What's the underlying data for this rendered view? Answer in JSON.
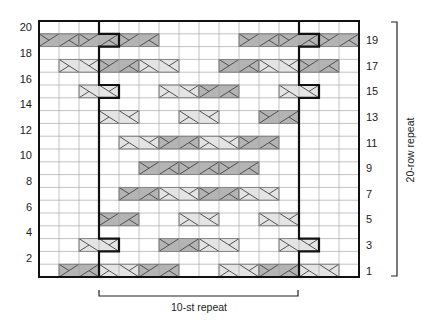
{
  "chart_data": {
    "type": "knitting-cable-chart",
    "title": "",
    "columns": 16,
    "rows": 20,
    "left_row_labels": [
      "2",
      "4",
      "6",
      "8",
      "10",
      "12",
      "14",
      "16",
      "18",
      "20"
    ],
    "right_row_labels": [
      "1",
      "3",
      "5",
      "7",
      "9",
      "11",
      "13",
      "15",
      "17",
      "19"
    ],
    "stitch_repeat_label": "10-st repeat",
    "row_repeat_label": "20-row repeat",
    "repeat_columns": [
      3,
      12
    ],
    "repeat_jog_rows": [
      3,
      15,
      19
    ],
    "colors": {
      "light": "#e4e4e4",
      "dark": "#b4b4b4",
      "grid": "#9a9a9a",
      "outline": "#111111"
    },
    "cables": [
      {
        "row": 19,
        "col": 0,
        "shade": "dark",
        "dir": "right"
      },
      {
        "row": 19,
        "col": 2,
        "shade": "dark",
        "dir": "right"
      },
      {
        "row": 19,
        "col": 4,
        "shade": "dark",
        "dir": "right"
      },
      {
        "row": 19,
        "col": 10,
        "shade": "dark",
        "dir": "right"
      },
      {
        "row": 19,
        "col": 12,
        "shade": "dark",
        "dir": "right"
      },
      {
        "row": 19,
        "col": 14,
        "shade": "dark",
        "dir": "right"
      },
      {
        "row": 17,
        "col": 1,
        "shade": "light",
        "dir": "left"
      },
      {
        "row": 17,
        "col": 3,
        "shade": "dark",
        "dir": "right"
      },
      {
        "row": 17,
        "col": 5,
        "shade": "light",
        "dir": "left"
      },
      {
        "row": 17,
        "col": 9,
        "shade": "dark",
        "dir": "right"
      },
      {
        "row": 17,
        "col": 11,
        "shade": "light",
        "dir": "left"
      },
      {
        "row": 17,
        "col": 13,
        "shade": "dark",
        "dir": "right"
      },
      {
        "row": 15,
        "col": 2,
        "shade": "light",
        "dir": "left"
      },
      {
        "row": 15,
        "col": 6,
        "shade": "light",
        "dir": "left"
      },
      {
        "row": 15,
        "col": 8,
        "shade": "dark",
        "dir": "right"
      },
      {
        "row": 15,
        "col": 12,
        "shade": "light",
        "dir": "left"
      },
      {
        "row": 13,
        "col": 3,
        "shade": "light",
        "dir": "left"
      },
      {
        "row": 13,
        "col": 7,
        "shade": "light",
        "dir": "left"
      },
      {
        "row": 13,
        "col": 11,
        "shade": "dark",
        "dir": "right"
      },
      {
        "row": 11,
        "col": 4,
        "shade": "light",
        "dir": "left"
      },
      {
        "row": 11,
        "col": 6,
        "shade": "dark",
        "dir": "right"
      },
      {
        "row": 11,
        "col": 8,
        "shade": "light",
        "dir": "left"
      },
      {
        "row": 11,
        "col": 10,
        "shade": "dark",
        "dir": "right"
      },
      {
        "row": 9,
        "col": 5,
        "shade": "dark",
        "dir": "right"
      },
      {
        "row": 9,
        "col": 7,
        "shade": "dark",
        "dir": "right"
      },
      {
        "row": 9,
        "col": 9,
        "shade": "dark",
        "dir": "right"
      },
      {
        "row": 7,
        "col": 4,
        "shade": "dark",
        "dir": "right"
      },
      {
        "row": 7,
        "col": 6,
        "shade": "light",
        "dir": "left"
      },
      {
        "row": 7,
        "col": 8,
        "shade": "dark",
        "dir": "right"
      },
      {
        "row": 7,
        "col": 10,
        "shade": "light",
        "dir": "left"
      },
      {
        "row": 5,
        "col": 3,
        "shade": "dark",
        "dir": "right"
      },
      {
        "row": 5,
        "col": 7,
        "shade": "light",
        "dir": "left"
      },
      {
        "row": 5,
        "col": 11,
        "shade": "light",
        "dir": "left"
      },
      {
        "row": 3,
        "col": 2,
        "shade": "light",
        "dir": "left"
      },
      {
        "row": 3,
        "col": 6,
        "shade": "dark",
        "dir": "right"
      },
      {
        "row": 3,
        "col": 8,
        "shade": "light",
        "dir": "left"
      },
      {
        "row": 3,
        "col": 12,
        "shade": "light",
        "dir": "left"
      },
      {
        "row": 1,
        "col": 1,
        "shade": "dark",
        "dir": "right"
      },
      {
        "row": 1,
        "col": 3,
        "shade": "light",
        "dir": "left"
      },
      {
        "row": 1,
        "col": 5,
        "shade": "dark",
        "dir": "right"
      },
      {
        "row": 1,
        "col": 9,
        "shade": "light",
        "dir": "left"
      },
      {
        "row": 1,
        "col": 11,
        "shade": "dark",
        "dir": "right"
      },
      {
        "row": 1,
        "col": 13,
        "shade": "light",
        "dir": "left"
      }
    ]
  }
}
